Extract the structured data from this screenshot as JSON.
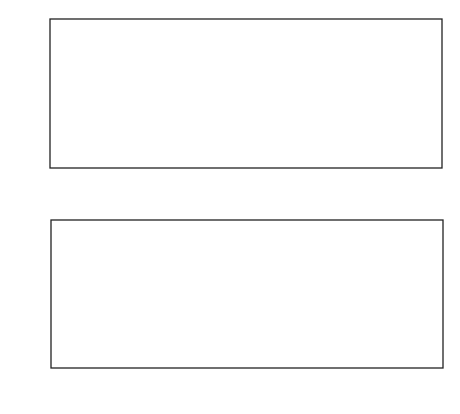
{
  "chart_data": [
    {
      "type": "scatter",
      "title": "",
      "xlabel": "time",
      "ylabel": "amplitude",
      "xlim": [
        -4,
        104
      ],
      "ylim": [
        -2.85,
        2.85
      ],
      "xticks": [
        0,
        10,
        20,
        30,
        40,
        50,
        60,
        70,
        80,
        90,
        100
      ],
      "xtick_labels": [
        "0",
        "10",
        "20",
        "30",
        "40",
        "50",
        "60",
        "70",
        "80",
        "90",
        "100"
      ],
      "yticks": [
        -2,
        -1,
        0,
        1,
        2
      ],
      "ytick_labels": [
        "−2",
        "−1",
        "0",
        "1",
        "2"
      ],
      "grid": false,
      "marker": "open-circle",
      "points": [
        [
          0.5,
          1.67
        ],
        [
          1.0,
          -0.58
        ],
        [
          2.0,
          1.53
        ],
        [
          3.2,
          0.33
        ],
        [
          4.5,
          -1.78
        ],
        [
          4.5,
          -2.05
        ],
        [
          6.0,
          -2.6
        ],
        [
          6.1,
          -0.44
        ],
        [
          6.4,
          2.4
        ],
        [
          7.3,
          -0.17
        ],
        [
          11.2,
          -0.72
        ],
        [
          12.3,
          0.37
        ],
        [
          12.8,
          0.49
        ],
        [
          13.0,
          -0.39
        ],
        [
          13.2,
          -0.17
        ],
        [
          13.5,
          -0.28
        ],
        [
          13.6,
          -0.53
        ],
        [
          15.9,
          0.76
        ],
        [
          16.6,
          0.2
        ],
        [
          17.8,
          2.5
        ],
        [
          21.0,
          -1.57
        ],
        [
          21.0,
          -2.09
        ],
        [
          23.0,
          0.63
        ],
        [
          23.5,
          -0.22
        ],
        [
          24.5,
          0.94
        ],
        [
          25.3,
          0.22
        ],
        [
          25.8,
          -1.62
        ],
        [
          26.3,
          -0.58
        ],
        [
          29.2,
          1.18
        ],
        [
          29.4,
          -0.24
        ],
        [
          31.5,
          0.6
        ],
        [
          33.0,
          -1.72
        ],
        [
          33.4,
          -2.17
        ],
        [
          34.0,
          0.17
        ],
        [
          34.5,
          0.09
        ],
        [
          35.0,
          1.74
        ],
        [
          36.4,
          -1.15
        ],
        [
          38.1,
          -0.86
        ],
        [
          39.1,
          0.3
        ],
        [
          40.0,
          -0.86
        ],
        [
          40.6,
          0.97
        ],
        [
          42.7,
          0.64
        ],
        [
          42.9,
          -0.3
        ],
        [
          43.0,
          -0.45
        ],
        [
          43.6,
          -0.7
        ],
        [
          43.7,
          -1.3
        ],
        [
          44.4,
          0.7
        ],
        [
          44.8,
          0.45
        ],
        [
          45.2,
          0.32
        ],
        [
          45.6,
          0.3
        ],
        [
          46.2,
          -0.99
        ],
        [
          47.2,
          1.35
        ],
        [
          48.2,
          -1.45
        ],
        [
          49.0,
          1.55
        ],
        [
          49.2,
          -0.99
        ],
        [
          50.4,
          -1.55
        ],
        [
          51.0,
          -0.99
        ],
        [
          51.4,
          -1.35
        ],
        [
          52.5,
          -0.99
        ],
        [
          53.8,
          0.06
        ],
        [
          54.5,
          -0.29
        ],
        [
          54.9,
          -0.85
        ],
        [
          55.1,
          -0.32
        ],
        [
          55.4,
          0.96
        ],
        [
          56.2,
          -1.36
        ],
        [
          57.9,
          -0.9
        ],
        [
          58.3,
          0.16
        ],
        [
          59.6,
          1.48
        ],
        [
          60.8,
          1.53
        ],
        [
          61.2,
          1.07
        ],
        [
          62.0,
          -0.48
        ],
        [
          62.5,
          -0.38
        ],
        [
          63.0,
          -0.35
        ],
        [
          63.3,
          1.13
        ],
        [
          64.0,
          -0.33
        ],
        [
          65.0,
          0.16
        ],
        [
          65.2,
          1.42
        ],
        [
          66.4,
          -2.04
        ],
        [
          68.3,
          -0.7
        ],
        [
          68.6,
          0.91
        ],
        [
          70.4,
          -1.54
        ],
        [
          71.0,
          1.93
        ],
        [
          71.8,
          -1.26
        ],
        [
          73.1,
          1.85
        ],
        [
          74.6,
          1.43
        ],
        [
          75.2,
          -1.72
        ],
        [
          77.3,
          1.81
        ],
        [
          80.7,
          0.48
        ],
        [
          81.0,
          1.22
        ],
        [
          81.7,
          -0.41
        ],
        [
          83.0,
          -1.27
        ],
        [
          84.6,
          0.71
        ],
        [
          85.1,
          -1.55
        ],
        [
          85.7,
          1.33
        ],
        [
          87.7,
          -0.8
        ],
        [
          91.5,
          0.11
        ],
        [
          91.7,
          -1.75
        ],
        [
          92.2,
          0.38
        ],
        [
          92.3,
          1.55
        ],
        [
          93.0,
          -0.1
        ],
        [
          96.2,
          -0.68
        ],
        [
          99.3,
          -0.23
        ]
      ]
    },
    {
      "type": "line",
      "title": "",
      "xlabel": "frequency",
      "ylabel": "power",
      "xlim": [
        -0.045,
        1.07
      ],
      "ylim": [
        -0.4,
        14.4
      ],
      "xticks": [
        0,
        0.1,
        0.2,
        0.3,
        0.4,
        0.5,
        0.6,
        0.7,
        0.8,
        0.9,
        1.0
      ],
      "xtick_labels": [
        "0",
        ".1",
        ".2",
        ".3",
        ".4",
        ".5",
        ".6",
        ".7",
        ".8",
        ".9",
        "1"
      ],
      "yticks": [
        0,
        2,
        4,
        6,
        8,
        10,
        12,
        14
      ],
      "ytick_labels": [
        "0",
        "2",
        "4",
        "6",
        "8",
        "10",
        "12",
        "14"
      ],
      "grid": false,
      "series": [
        {
          "name": "power spectrum",
          "x": [
            0.01,
            0.02,
            0.03,
            0.04,
            0.05,
            0.055,
            0.06,
            0.065,
            0.07,
            0.075,
            0.08,
            0.09,
            0.1,
            0.105,
            0.11,
            0.115,
            0.12,
            0.125,
            0.13,
            0.135,
            0.14,
            0.145,
            0.15,
            0.155,
            0.16,
            0.165,
            0.17,
            0.175,
            0.18,
            0.185,
            0.19,
            0.195,
            0.2,
            0.205,
            0.21,
            0.215,
            0.22,
            0.225,
            0.23,
            0.235,
            0.24,
            0.245,
            0.25,
            0.255,
            0.26,
            0.265,
            0.27,
            0.275,
            0.28,
            0.285,
            0.29,
            0.295,
            0.3,
            0.305,
            0.31,
            0.315,
            0.32,
            0.325,
            0.33,
            0.335,
            0.34,
            0.345,
            0.35,
            0.36,
            0.37,
            0.375,
            0.38,
            0.385,
            0.39,
            0.395,
            0.4,
            0.405,
            0.41,
            0.415,
            0.42,
            0.425,
            0.43,
            0.435,
            0.44,
            0.445,
            0.45,
            0.455,
            0.46,
            0.465,
            0.47,
            0.475,
            0.48,
            0.485,
            0.49,
            0.495,
            0.5,
            0.505,
            0.51,
            0.515,
            0.52,
            0.525,
            0.53,
            0.535,
            0.54,
            0.545,
            0.55,
            0.555,
            0.56,
            0.565,
            0.57,
            0.575,
            0.58,
            0.585,
            0.59,
            0.595,
            0.6,
            0.605,
            0.61,
            0.615,
            0.62,
            0.625,
            0.63,
            0.635,
            0.64,
            0.645,
            0.65,
            0.655,
            0.66,
            0.665,
            0.67,
            0.675,
            0.68,
            0.685,
            0.69,
            0.695,
            0.7,
            0.705,
            0.71,
            0.715,
            0.72,
            0.725,
            0.73,
            0.735,
            0.74,
            0.745,
            0.75,
            0.755,
            0.76,
            0.765,
            0.77,
            0.775,
            0.78,
            0.785,
            0.79,
            0.795,
            0.8,
            0.805,
            0.81,
            0.815,
            0.82,
            0.825,
            0.83,
            0.835,
            0.84,
            0.845,
            0.85,
            0.855,
            0.86,
            0.865,
            0.87,
            0.875,
            0.88,
            0.885,
            0.89,
            0.895,
            0.9,
            0.905,
            0.91,
            0.915,
            0.92,
            0.925,
            0.93,
            0.935,
            0.94,
            0.945,
            0.95,
            0.955,
            0.96,
            0.965,
            0.97,
            0.975,
            0.98,
            0.985,
            0.99,
            0.995,
            1.0,
            1.005,
            1.01
          ],
          "y": [
            0.8,
            0.5,
            0.2,
            0.6,
            1.2,
            0.4,
            1.5,
            3.1,
            1.2,
            0.2,
            0.5,
            0.3,
            0.6,
            0.4,
            1.3,
            0.9,
            0.4,
            2.6,
            1.0,
            1.6,
            0.7,
            1.8,
            1.3,
            2.0,
            1.5,
            3.6,
            1.8,
            2.8,
            1.2,
            2.1,
            1.5,
            0.4,
            0.9,
            1.8,
            0.5,
            0.3,
            0.6,
            2.4,
            0.8,
            3.0,
            0.6,
            2.7,
            0.3,
            1.2,
            0.4,
            2.5,
            0.5,
            3.1,
            0.4,
            0.8,
            1.8,
            0.9,
            0.4,
            0.3,
            0.6,
            1.5,
            0.7,
            1.2,
            1.0,
            3.1,
            1.3,
            0.8,
            2.4,
            0.6,
            0.3,
            1.1,
            1.8,
            1.4,
            0.6,
            2.3,
            1.3,
            2.0,
            1.7,
            2.2,
            1.6,
            0.5,
            2.1,
            1.3,
            0.4,
            0.9,
            0.6,
            0.3,
            1.2,
            0.4,
            0.8,
            0.5,
            1.9,
            1.2,
            2.6,
            0.5,
            1.0,
            2.5,
            0.5,
            1.7,
            0.2,
            2.7,
            0.3,
            2.6,
            0.4,
            2.7,
            0.6,
            3.2,
            1.4,
            2.4,
            0.5,
            0.4,
            1.0,
            0.4,
            0.9,
            1.5,
            0.6,
            0.8,
            2.3,
            0.5,
            1.8,
            3.1,
            0.4,
            1.1,
            5.2,
            2.0,
            0.5,
            0.5,
            0.3,
            0.7,
            0.3,
            0.6,
            1.0,
            0.3,
            0.6,
            5.2,
            12.9,
            5.8,
            0.4,
            0.8,
            1.9,
            0.7,
            0.5,
            0.8,
            2.9,
            1.3,
            0.5,
            0.4,
            0.6,
            0.3,
            1.4,
            0.6,
            2.0,
            0.4,
            0.6,
            1.4,
            2.6,
            0.6,
            0.6,
            2.4,
            1.6,
            0.6,
            0.4,
            0.8,
            0.3,
            0.7,
            0.5,
            0.4,
            1.1,
            0.5,
            0.3,
            1.8,
            1.2,
            0.8,
            0.4,
            0.2,
            0.3,
            0.2,
            0.5,
            0.3,
            1.5,
            1.0,
            0.7,
            1.5,
            1.2,
            0.5,
            0.4,
            0.3,
            0.8,
            0.4,
            0.2,
            0.4,
            0.3
          ]
        }
      ],
      "significance_levels": [
        {
          "label": ".001",
          "power": 12.2,
          "style": "dotted"
        },
        {
          "label": ".005",
          "power": 10.8,
          "style": "dotted"
        },
        {
          "label": ".01",
          "power": 10.1,
          "style": "dashed-short"
        },
        {
          "label": ".05",
          "power": 8.4,
          "style": "dashed-short"
        },
        {
          "label": ".1",
          "power": 7.7,
          "style": "dashed-long"
        },
        {
          "label": ".5",
          "power": 5.8,
          "style": "dashed-long"
        }
      ],
      "annotations": [
        {
          "text": "significance levels",
          "x": 0.16,
          "y": 9.0,
          "rotation": -45
        }
      ]
    }
  ]
}
